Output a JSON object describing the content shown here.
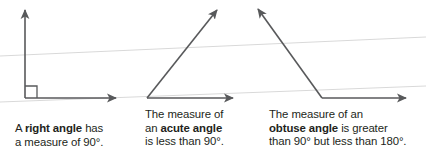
{
  "figure": {
    "width": 426,
    "height": 163,
    "background_color": "#ffffff",
    "line_color": "#58595b",
    "guide_line_color": "#d9d9d9",
    "text_color": "#231f20"
  },
  "guide_lines": [
    {
      "name": "upper-guide-line",
      "x1": 0,
      "y1": 56,
      "x2": 426,
      "y2": 37
    },
    {
      "name": "lower-guide-line",
      "x1": 0,
      "y1": 102,
      "x2": 426,
      "y2": 86
    }
  ],
  "angles": [
    {
      "id": "right-angle",
      "type": "right",
      "measure_text": "90°",
      "has_square_marker": true,
      "vertex": {
        "x": 25,
        "y": 98
      },
      "ray_1_tip": {
        "x": 25,
        "y": 8
      },
      "ray_2_tip": {
        "x": 118,
        "y": 98
      },
      "caption": {
        "lines": [
          {
            "pre": "A ",
            "bold": "right angle",
            "post": " has"
          },
          {
            "pre": "a measure of 90°.",
            "bold": "",
            "post": ""
          }
        ]
      }
    },
    {
      "id": "acute-angle",
      "type": "acute",
      "measure_text": "less than 90°",
      "has_square_marker": false,
      "vertex": {
        "x": 147,
        "y": 98
      },
      "ray_1_tip": {
        "x": 220,
        "y": 7
      },
      "ray_2_tip": {
        "x": 235,
        "y": 98
      },
      "caption": {
        "lines": [
          {
            "pre": "The measure of",
            "bold": "",
            "post": ""
          },
          {
            "pre": "an ",
            "bold": "acute angle",
            "post": ""
          },
          {
            "pre": "is less than 90°.",
            "bold": "",
            "post": ""
          }
        ]
      }
    },
    {
      "id": "obtuse-angle",
      "type": "obtuse",
      "measure_text": "greater than 90° but less than 180°",
      "has_square_marker": false,
      "vertex": {
        "x": 322,
        "y": 98
      },
      "ray_1_tip": {
        "x": 256,
        "y": 6
      },
      "ray_2_tip": {
        "x": 408,
        "y": 98
      },
      "caption": {
        "lines": [
          {
            "pre": "The measure of an",
            "bold": "",
            "post": ""
          },
          {
            "pre": "",
            "bold": "obtuse angle",
            "post": " is greater"
          },
          {
            "pre": "than 90° but less than 180°.",
            "bold": "",
            "post": ""
          }
        ]
      }
    }
  ],
  "captions": {
    "right_angle": {
      "line1_pre": "A ",
      "line1_bold": "right angle",
      "line1_post": " has",
      "line2": "a measure of 90°."
    },
    "acute_angle": {
      "line1": "The measure of",
      "line2_pre": "an ",
      "line2_bold": "acute angle",
      "line3": "is less than 90°."
    },
    "obtuse_angle": {
      "line1": "The measure of an",
      "line2_bold": "obtuse angle",
      "line2_post": " is greater",
      "line3": "than 90° but less than 180°."
    }
  }
}
